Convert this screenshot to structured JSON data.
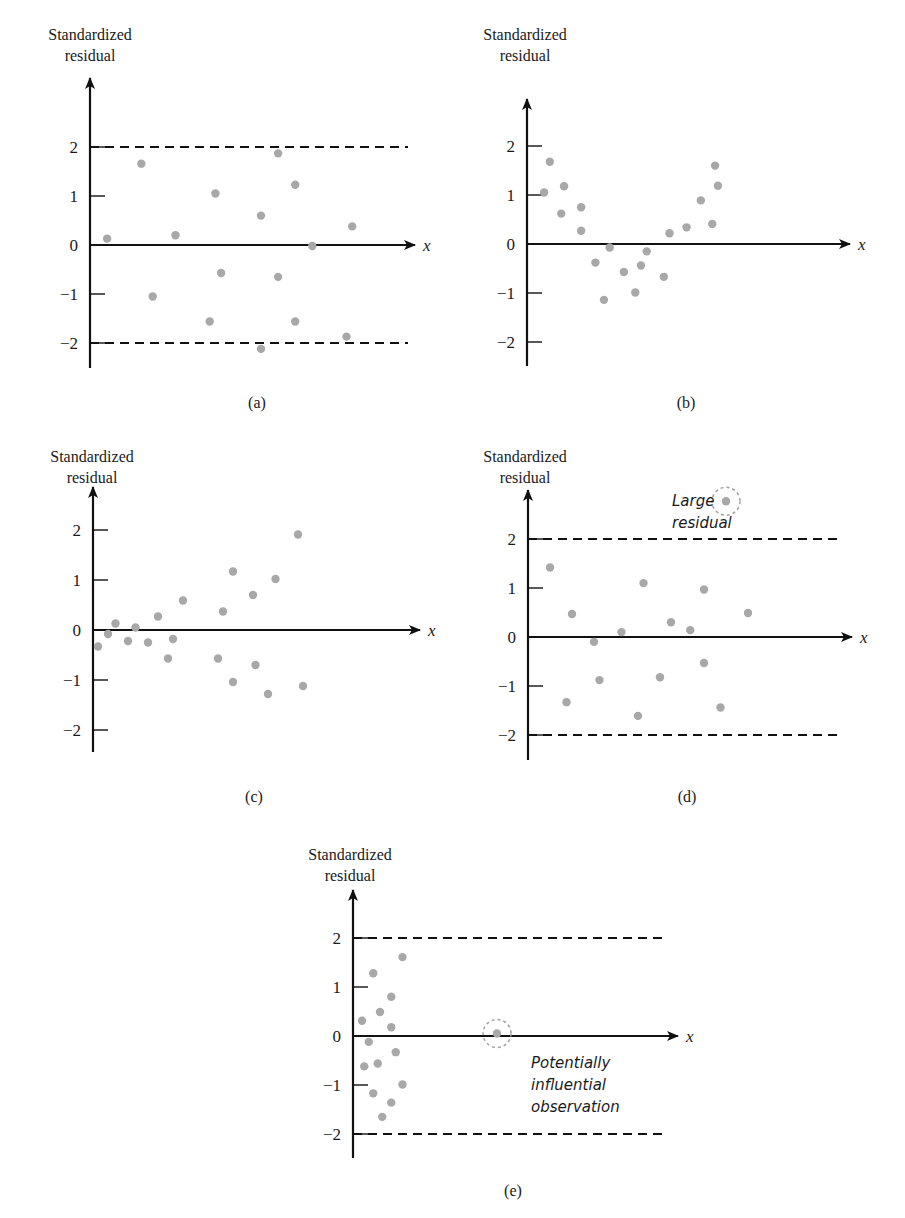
{
  "figure": {
    "panels": [
      {
        "id": "a",
        "label": "(a)",
        "y_title": [
          "Standardized",
          "residual"
        ],
        "x_label": "x",
        "bounds": true
      },
      {
        "id": "b",
        "label": "(b)",
        "y_title": [
          "Standardized",
          "residual"
        ],
        "x_label": "x",
        "bounds": false
      },
      {
        "id": "c",
        "label": "(c)",
        "y_title": [
          "Standardized",
          "residual"
        ],
        "x_label": "x",
        "bounds": false
      },
      {
        "id": "d",
        "label": "(d)",
        "y_title": [
          "Standardized",
          "residual"
        ],
        "x_label": "x",
        "bounds": true,
        "annotation": [
          "Large",
          "residual"
        ]
      },
      {
        "id": "e",
        "label": "(e)",
        "y_title": [
          "Standardized",
          "residual"
        ],
        "x_label": "x",
        "bounds": true,
        "annotation": [
          "Potentially",
          "influential",
          "observation"
        ]
      }
    ],
    "tick_labels": [
      "2",
      "1",
      "0",
      "−1",
      "−2"
    ],
    "colors": {
      "point": "#a8a8a8",
      "axis": "#111111",
      "circle": "#a0a0a0"
    }
  },
  "chart_data": [
    {
      "type": "scatter",
      "panel": "(a)",
      "title": "",
      "xlabel": "x",
      "ylabel": "Standardized residual",
      "ylim": [
        -2.5,
        2.5
      ],
      "yticks": [
        -2,
        -1,
        0,
        1,
        2
      ],
      "reference_lines": [
        -2,
        2
      ],
      "grid": false,
      "legend": null,
      "points": [
        [
          0.3,
          0.13
        ],
        [
          0.9,
          1.66
        ],
        [
          1.1,
          -1.05
        ],
        [
          1.5,
          0.2
        ],
        [
          2.2,
          1.05
        ],
        [
          2.3,
          -0.57
        ],
        [
          2.1,
          -1.56
        ],
        [
          3.0,
          0.6
        ],
        [
          3.3,
          -0.65
        ],
        [
          3.3,
          1.87
        ],
        [
          3.6,
          1.23
        ],
        [
          3.6,
          -1.56
        ],
        [
          3.9,
          -0.02
        ],
        [
          4.6,
          0.38
        ],
        [
          4.5,
          -1.87
        ],
        [
          3.0,
          -2.12
        ]
      ]
    },
    {
      "type": "scatter",
      "panel": "(b)",
      "title": "",
      "xlabel": "x",
      "ylabel": "Standardized residual",
      "ylim": [
        -2.5,
        2.5
      ],
      "yticks": [
        -2,
        -1,
        0,
        1,
        2
      ],
      "reference_lines": [],
      "grid": false,
      "legend": null,
      "points": [
        [
          0.3,
          1.05
        ],
        [
          0.4,
          1.68
        ],
        [
          0.6,
          0.62
        ],
        [
          0.65,
          1.18
        ],
        [
          0.95,
          0.75
        ],
        [
          0.95,
          0.27
        ],
        [
          1.2,
          -0.38
        ],
        [
          1.35,
          -1.14
        ],
        [
          1.45,
          -0.07
        ],
        [
          1.7,
          -0.57
        ],
        [
          1.9,
          -0.99
        ],
        [
          2.0,
          -0.44
        ],
        [
          2.1,
          -0.15
        ],
        [
          2.4,
          -0.67
        ],
        [
          2.5,
          0.22
        ],
        [
          2.8,
          0.34
        ],
        [
          3.05,
          0.89
        ],
        [
          3.25,
          0.41
        ],
        [
          3.3,
          1.6
        ],
        [
          3.35,
          1.19
        ]
      ]
    },
    {
      "type": "scatter",
      "panel": "(c)",
      "title": "",
      "xlabel": "x",
      "ylabel": "Standardized residual",
      "ylim": [
        -2.5,
        2.5
      ],
      "yticks": [
        -2,
        -1,
        0,
        1,
        2
      ],
      "reference_lines": [],
      "grid": false,
      "legend": null,
      "points": [
        [
          0.1,
          -0.33
        ],
        [
          0.3,
          -0.08
        ],
        [
          0.45,
          0.13
        ],
        [
          0.7,
          -0.22
        ],
        [
          0.85,
          0.05
        ],
        [
          1.1,
          -0.25
        ],
        [
          1.3,
          0.27
        ],
        [
          1.5,
          -0.57
        ],
        [
          1.6,
          -0.18
        ],
        [
          1.8,
          0.59
        ],
        [
          2.5,
          -0.57
        ],
        [
          2.6,
          0.37
        ],
        [
          2.8,
          1.17
        ],
        [
          2.8,
          -1.04
        ],
        [
          3.2,
          0.7
        ],
        [
          3.25,
          -0.7
        ],
        [
          3.5,
          -1.28
        ],
        [
          3.65,
          1.02
        ],
        [
          4.2,
          -1.12
        ],
        [
          4.1,
          1.91
        ]
      ]
    },
    {
      "type": "scatter",
      "panel": "(d)",
      "title": "",
      "xlabel": "x",
      "ylabel": "Standardized residual",
      "ylim": [
        -2.5,
        2.9
      ],
      "yticks": [
        -2,
        -1,
        0,
        1,
        2
      ],
      "reference_lines": [
        -2,
        2
      ],
      "grid": false,
      "legend": null,
      "points": [
        [
          0.4,
          1.42
        ],
        [
          0.7,
          -1.33
        ],
        [
          0.8,
          0.47
        ],
        [
          1.2,
          -0.1
        ],
        [
          1.3,
          -0.88
        ],
        [
          1.7,
          0.1
        ],
        [
          2.0,
          -1.61
        ],
        [
          2.1,
          1.1
        ],
        [
          2.4,
          -0.82
        ],
        [
          2.6,
          0.3
        ],
        [
          2.95,
          0.14
        ],
        [
          3.2,
          -0.53
        ],
        [
          3.2,
          0.97
        ],
        [
          3.5,
          -1.44
        ],
        [
          4.0,
          0.49
        ]
      ],
      "highlighted": [
        {
          "x": 3.6,
          "y": 2.77,
          "label": "Large residual"
        }
      ]
    },
    {
      "type": "scatter",
      "panel": "(e)",
      "title": "",
      "xlabel": "x",
      "ylabel": "Standardized residual",
      "ylim": [
        -2.5,
        2.5
      ],
      "yticks": [
        -2,
        -1,
        0,
        1,
        2
      ],
      "reference_lines": [
        -2,
        2
      ],
      "grid": false,
      "legend": null,
      "points": [
        [
          0.2,
          0.31
        ],
        [
          0.25,
          -0.62
        ],
        [
          0.35,
          -0.12
        ],
        [
          0.45,
          1.28
        ],
        [
          0.45,
          -1.17
        ],
        [
          0.55,
          -0.56
        ],
        [
          0.6,
          0.49
        ],
        [
          0.65,
          -1.65
        ],
        [
          0.85,
          0.8
        ],
        [
          0.85,
          0.18
        ],
        [
          0.85,
          -1.36
        ],
        [
          0.95,
          -0.33
        ],
        [
          1.1,
          1.61
        ],
        [
          1.1,
          -0.99
        ]
      ],
      "highlighted": [
        {
          "x": 3.2,
          "y": 0.05,
          "label": "Potentially influential observation"
        }
      ]
    }
  ]
}
